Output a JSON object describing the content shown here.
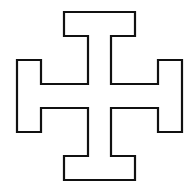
{
  "figure": {
    "shape": "cross-potent",
    "stroke_color": "#111111",
    "fill_color": "#ffffff",
    "background": "#ffffff",
    "stroke_width": 2.2,
    "outline_points": "64,12 135,12 135,36 111,36 111,84 158,84 158,60 182,60 182,132 158,132 158,108 111,108 111,156 135,156 135,180 64,180 64,156 88,156 88,108 41,108 41,132 17,132 17,60 41,60 41,84 88,84 88,36 64,36"
  }
}
